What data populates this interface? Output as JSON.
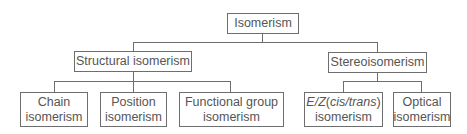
{
  "diagram": {
    "type": "tree",
    "root": {
      "label": "Isomerism",
      "children": [
        {
          "label": "Structural isomerism",
          "children": [
            {
              "label_line1": "Chain",
              "label_line2": "isomerism"
            },
            {
              "label_line1": "Position",
              "label_line2": "isomerism"
            },
            {
              "label_line1": "Functional group",
              "label_line2": "isomerism"
            }
          ]
        },
        {
          "label": "Stereoisomerism",
          "children": [
            {
              "label_line1_parts": [
                "E/Z",
                "(",
                "cis/trans",
                ")"
              ],
              "label_line2": "isomerism"
            },
            {
              "label_line1": "Optical",
              "label_line2": "isomerism"
            }
          ]
        }
      ]
    },
    "colors": {
      "line": "#6e6e6e",
      "text": "#555555",
      "background": "#ffffff"
    }
  }
}
